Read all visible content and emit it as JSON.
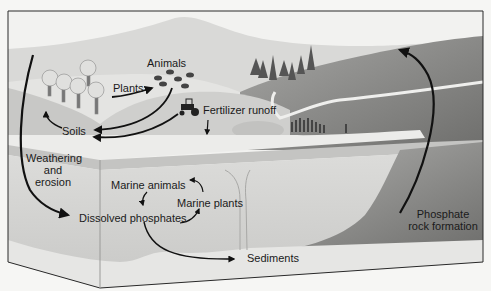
{
  "labels": {
    "animals": "Animals",
    "plants": "Plants",
    "soils": "Soils",
    "fertilizer_runoff": "Fertilizer runoff",
    "weathering_line1": "Weathering",
    "weathering_line2": "and",
    "weathering_line3": "erosion",
    "marine_animals": "Marine animals",
    "marine_plants": "Marine plants",
    "dissolved_phosphates": "Dissolved phosphates",
    "sediments": "Sediments",
    "rock_line1": "Phosphate",
    "rock_line2": "rock formation"
  },
  "icons": [
    "deciduous-tree-icon",
    "animal-herd-icon",
    "tractor-icon",
    "conifer-tree-icon",
    "arrow-icon"
  ],
  "colors": {
    "background": "#f6f6f4",
    "sky": "#f2f2f0",
    "far_hill": "#d9d9d7",
    "mid_hill": "#c4c4c2",
    "right_mountain": "#8e8e8c",
    "shore": "#ececea",
    "ocean": "#d3d3d1",
    "ocean_surface": "#bdbdbb",
    "seabed": "#e6e6e4",
    "arrow": "#111111"
  }
}
